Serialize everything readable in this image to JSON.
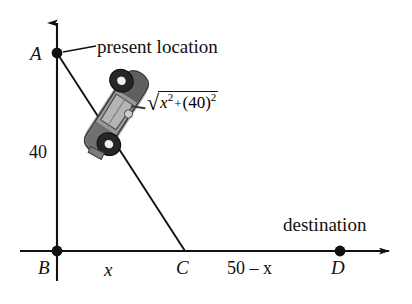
{
  "figure": {
    "background_color": "#ffffff",
    "line_color": "#111111",
    "axes": {
      "y_axis": {
        "name": "vertical-axis",
        "from": [
          57,
          280
        ],
        "to": [
          57,
          20
        ],
        "arrow": "up"
      },
      "x_axis": {
        "name": "horizontal-axis",
        "from": [
          20,
          251
        ],
        "to": [
          392,
          251
        ],
        "arrow": "right"
      }
    },
    "points": [
      {
        "id": "A",
        "label": "A",
        "x": 57,
        "y": 53,
        "name": "point-a"
      },
      {
        "id": "B",
        "label": "B",
        "x": 57,
        "y": 251,
        "name": "point-b"
      },
      {
        "id": "C",
        "label": "C",
        "x": 185,
        "y": 251,
        "name": "point-c"
      },
      {
        "id": "D",
        "label": "D",
        "x": 340,
        "y": 251,
        "name": "point-d"
      }
    ],
    "segments": {
      "hypotenuse": {
        "from": [
          57,
          53
        ],
        "to": [
          185,
          251
        ]
      },
      "leader": {
        "from": [
          62,
          52
        ],
        "to": [
          95,
          46
        ]
      }
    },
    "labels": {
      "point_a": "A",
      "point_b": "B",
      "point_c": "C",
      "point_d": "D",
      "segment_bc": "x",
      "segment_cd": "50 – x",
      "segment_ab": "40",
      "present_location": "present location",
      "destination": "destination"
    },
    "formula": {
      "radical_symbol": "√",
      "base_variable": "x",
      "exponent_1": "2",
      "operator": "+",
      "open_paren": "(",
      "constant": "40",
      "close_paren": ")",
      "exponent_2": "2",
      "plain_text": "√(x² + (40)²)"
    },
    "car": {
      "name": "car-icon",
      "description": "top-view car travelling along segment AC",
      "body_color": "#8c8c8c",
      "roof_color": "#6e6e6e",
      "wheel_color": "#2b2b2b",
      "hub_color": "#f2f2f2",
      "outline_color": "#3a3a3a",
      "rotation_deg": 33,
      "center": [
        116,
        113
      ]
    }
  }
}
